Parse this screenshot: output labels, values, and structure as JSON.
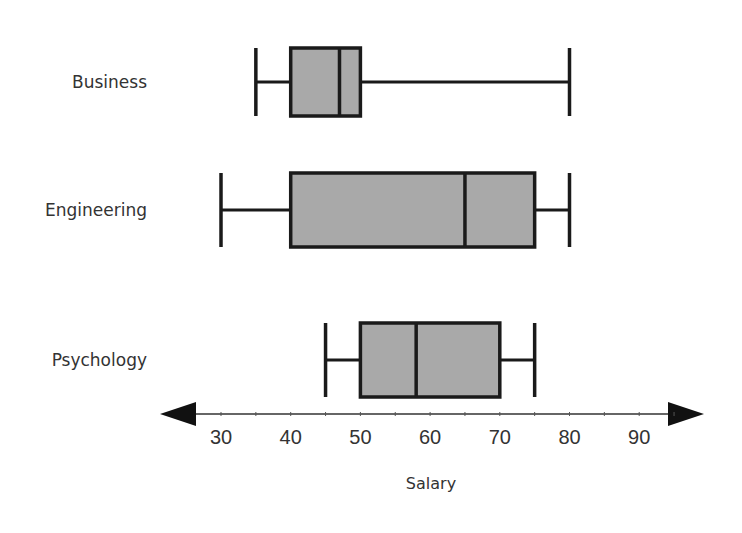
{
  "chart_data": {
    "type": "boxplot",
    "title": "",
    "xlabel": "Salary",
    "ylabel": "",
    "xlim": [
      25,
      95
    ],
    "ticks": [
      30,
      40,
      50,
      60,
      70,
      80,
      90
    ],
    "tick_labels": [
      "30",
      "40",
      "50",
      "60",
      "70",
      "80",
      "90"
    ],
    "grid": false,
    "legend": null,
    "categories": [
      "Business",
      "Engineering",
      "Psychology"
    ],
    "series": [
      {
        "name": "Business",
        "min": 35,
        "q1": 40,
        "median": 47,
        "q3": 50,
        "max": 80
      },
      {
        "name": "Engineering",
        "min": 30,
        "q1": 40,
        "median": 65,
        "q3": 75,
        "max": 80
      },
      {
        "name": "Psychology",
        "min": 45,
        "q1": 50,
        "median": 58,
        "q3": 70,
        "max": 75
      }
    ],
    "colors": {
      "box_fill": "#a9a9a9",
      "stroke": "#1a1a1a"
    }
  }
}
